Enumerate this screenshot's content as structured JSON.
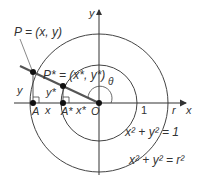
{
  "diagram": {
    "labels": {
      "P": "P = (x, y)",
      "P_star": "P* = (x*, y*)",
      "y_axis": "y",
      "x_axis": "x",
      "theta": "θ",
      "origin": "O",
      "A": "A",
      "A_star": "A*",
      "x_seg": "x",
      "x_star_seg": "x*",
      "y_seg": "y",
      "y_star_seg": "y*",
      "one": "1",
      "r": "r",
      "unit_circle_eq": "x² + y² = 1",
      "big_circle_eq": "x² + y² = r²"
    },
    "colors": {
      "stroke": "#333333",
      "ray": "#555555",
      "background": "#ffffff"
    }
  }
}
